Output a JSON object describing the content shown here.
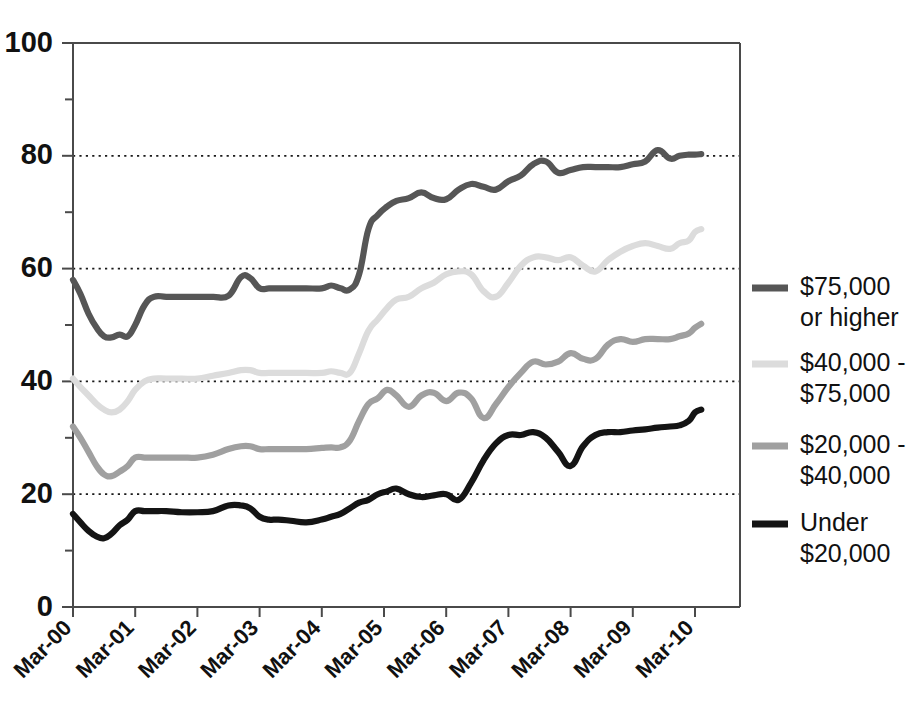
{
  "chart_data": {
    "type": "line",
    "title": "",
    "subtitle": "",
    "xlabel": "",
    "ylabel": "",
    "xlim": [
      0,
      10
    ],
    "ylim": [
      0,
      100
    ],
    "grid": "horizontal-dotted",
    "gridlines": [
      20,
      40,
      60,
      80
    ],
    "legend_position": "right",
    "y_ticks_major": [
      0,
      20,
      40,
      60,
      80,
      100
    ],
    "y_ticks_minor": [
      10,
      30,
      50,
      70,
      90
    ],
    "x_tick_labels": [
      "Mar-00",
      "Mar-01",
      "Mar-02",
      "Mar-03",
      "Mar-04",
      "Mar-05",
      "Mar-06",
      "Mar-07",
      "Mar-08",
      "Mar-09",
      "Mar-10"
    ],
    "x_tick_positions": [
      0,
      1,
      2,
      3,
      4,
      5,
      6,
      7,
      8,
      9,
      10
    ],
    "series": [
      {
        "name": "$75,000 or higher",
        "legend_label_line1": "$75,000",
        "legend_label_line2": "or higher",
        "color": "#565656",
        "x": [
          0.0,
          0.12,
          0.25,
          0.38,
          0.5,
          0.62,
          0.75,
          0.88,
          1.0,
          1.15,
          1.3,
          1.5,
          1.75,
          2.0,
          2.25,
          2.5,
          2.7,
          2.85,
          3.0,
          3.15,
          3.3,
          3.5,
          3.75,
          4.0,
          4.15,
          4.3,
          4.45,
          4.6,
          4.75,
          4.9,
          5.05,
          5.2,
          5.4,
          5.6,
          5.8,
          6.0,
          6.2,
          6.4,
          6.6,
          6.8,
          7.0,
          7.2,
          7.4,
          7.6,
          7.8,
          8.0,
          8.2,
          8.4,
          8.6,
          8.8,
          9.0,
          9.2,
          9.4,
          9.6,
          9.75,
          9.9,
          10.0,
          10.1
        ],
        "y": [
          58.0,
          55.5,
          52.0,
          49.5,
          48.0,
          47.8,
          48.3,
          48.0,
          50.0,
          53.5,
          55.0,
          55.0,
          55.0,
          55.0,
          55.0,
          55.2,
          58.5,
          58.3,
          56.5,
          56.5,
          56.5,
          56.5,
          56.5,
          56.5,
          57.0,
          56.5,
          56.3,
          59.0,
          67.0,
          69.5,
          71.0,
          72.0,
          72.5,
          73.5,
          72.5,
          72.3,
          74.0,
          75.0,
          74.5,
          74.0,
          75.5,
          76.5,
          78.5,
          79.0,
          77.0,
          77.5,
          78.0,
          78.0,
          78.0,
          78.0,
          78.5,
          79.0,
          81.0,
          79.5,
          80.0,
          80.2,
          80.2,
          80.3
        ]
      },
      {
        "name": "$40,000 - $75,000",
        "legend_label_line1": "$40,000 -",
        "legend_label_line2": "$75,000",
        "color": "#dcdcdc",
        "x": [
          0.0,
          0.12,
          0.25,
          0.38,
          0.5,
          0.62,
          0.75,
          0.88,
          1.0,
          1.15,
          1.3,
          1.5,
          1.75,
          2.0,
          2.25,
          2.5,
          2.7,
          2.85,
          3.0,
          3.15,
          3.3,
          3.5,
          3.75,
          4.0,
          4.15,
          4.3,
          4.45,
          4.6,
          4.75,
          4.9,
          5.05,
          5.2,
          5.4,
          5.6,
          5.8,
          6.0,
          6.2,
          6.4,
          6.6,
          6.8,
          7.0,
          7.2,
          7.4,
          7.6,
          7.8,
          8.0,
          8.2,
          8.4,
          8.6,
          8.8,
          9.0,
          9.2,
          9.4,
          9.6,
          9.75,
          9.9,
          10.0,
          10.1
        ],
        "y": [
          40.5,
          39.0,
          37.5,
          36.0,
          35.0,
          34.5,
          35.0,
          36.5,
          38.5,
          40.0,
          40.5,
          40.5,
          40.5,
          40.5,
          41.0,
          41.5,
          42.0,
          42.0,
          41.5,
          41.5,
          41.5,
          41.5,
          41.5,
          41.5,
          41.8,
          41.5,
          41.5,
          45.0,
          49.0,
          51.0,
          53.0,
          54.5,
          55.0,
          56.5,
          57.5,
          59.0,
          59.5,
          59.0,
          56.0,
          55.0,
          57.5,
          60.5,
          62.0,
          62.0,
          61.5,
          62.0,
          60.5,
          59.5,
          61.5,
          63.0,
          64.0,
          64.5,
          64.0,
          63.5,
          64.5,
          65.0,
          66.5,
          67.0
        ]
      },
      {
        "name": "$20,000 - $40,000",
        "legend_label_line1": "$20,000 -",
        "legend_label_line2": "$40,000",
        "color": "#a0a0a0",
        "x": [
          0.0,
          0.12,
          0.25,
          0.38,
          0.5,
          0.62,
          0.75,
          0.88,
          1.0,
          1.15,
          1.3,
          1.5,
          1.75,
          2.0,
          2.25,
          2.5,
          2.7,
          2.85,
          3.0,
          3.15,
          3.3,
          3.5,
          3.75,
          4.0,
          4.15,
          4.3,
          4.45,
          4.6,
          4.75,
          4.9,
          5.05,
          5.2,
          5.4,
          5.6,
          5.8,
          6.0,
          6.2,
          6.4,
          6.6,
          6.8,
          7.0,
          7.2,
          7.4,
          7.6,
          7.8,
          8.0,
          8.2,
          8.4,
          8.6,
          8.8,
          9.0,
          9.2,
          9.4,
          9.6,
          9.75,
          9.9,
          10.0,
          10.1
        ],
        "y": [
          32.0,
          30.0,
          27.5,
          25.0,
          23.5,
          23.2,
          24.0,
          25.0,
          26.5,
          26.5,
          26.5,
          26.5,
          26.5,
          26.5,
          27.0,
          28.0,
          28.5,
          28.5,
          28.0,
          28.0,
          28.0,
          28.0,
          28.0,
          28.2,
          28.3,
          28.3,
          29.5,
          33.0,
          36.0,
          37.0,
          38.5,
          37.5,
          35.5,
          37.5,
          38.0,
          36.5,
          38.0,
          37.0,
          33.5,
          36.0,
          39.0,
          41.5,
          43.5,
          43.0,
          43.5,
          45.0,
          44.0,
          44.0,
          46.5,
          47.5,
          47.0,
          47.5,
          47.5,
          47.5,
          48.0,
          48.5,
          49.5,
          50.2
        ]
      },
      {
        "name": "Under $20,000",
        "legend_label_line1": "Under",
        "legend_label_line2": "$20,000",
        "color": "#141414",
        "x": [
          0.0,
          0.12,
          0.25,
          0.38,
          0.5,
          0.62,
          0.75,
          0.88,
          1.0,
          1.15,
          1.3,
          1.5,
          1.75,
          2.0,
          2.25,
          2.5,
          2.7,
          2.85,
          3.0,
          3.15,
          3.3,
          3.5,
          3.75,
          4.0,
          4.15,
          4.3,
          4.45,
          4.6,
          4.75,
          4.9,
          5.05,
          5.2,
          5.4,
          5.6,
          5.8,
          6.0,
          6.2,
          6.4,
          6.6,
          6.8,
          7.0,
          7.2,
          7.4,
          7.6,
          7.8,
          8.0,
          8.2,
          8.4,
          8.6,
          8.8,
          9.0,
          9.2,
          9.4,
          9.6,
          9.75,
          9.9,
          10.0,
          10.1
        ],
        "y": [
          16.5,
          15.0,
          13.5,
          12.5,
          12.2,
          13.0,
          14.5,
          15.5,
          17.0,
          17.0,
          17.0,
          17.0,
          16.8,
          16.8,
          17.0,
          18.0,
          18.0,
          17.5,
          16.0,
          15.5,
          15.5,
          15.3,
          15.0,
          15.5,
          16.0,
          16.5,
          17.5,
          18.5,
          19.0,
          20.0,
          20.5,
          21.0,
          20.0,
          19.5,
          19.8,
          20.0,
          19.0,
          22.0,
          26.0,
          29.0,
          30.5,
          30.5,
          31.0,
          30.0,
          27.5,
          25.0,
          28.5,
          30.5,
          31.0,
          31.0,
          31.3,
          31.5,
          31.8,
          32.0,
          32.2,
          33.0,
          34.5,
          35.0
        ]
      }
    ]
  },
  "legend": {
    "items": [
      {
        "label_line1": "$75,000",
        "label_line2": "or higher",
        "color": "#565656"
      },
      {
        "label_line1": "$40,000 -",
        "label_line2": "$75,000",
        "color": "#dcdcdc"
      },
      {
        "label_line1": "$20,000 -",
        "label_line2": "$40,000",
        "color": "#a0a0a0"
      },
      {
        "label_line1": "Under",
        "label_line2": "$20,000",
        "color": "#141414"
      }
    ]
  },
  "axes": {
    "y_labels": [
      "100",
      "80",
      "60",
      "40",
      "20",
      "0"
    ],
    "y_values": [
      100,
      80,
      60,
      40,
      20,
      0
    ],
    "x_labels": [
      "Mar-00",
      "Mar-01",
      "Mar-02",
      "Mar-03",
      "Mar-04",
      "Mar-05",
      "Mar-06",
      "Mar-07",
      "Mar-08",
      "Mar-09",
      "Mar-10"
    ]
  }
}
